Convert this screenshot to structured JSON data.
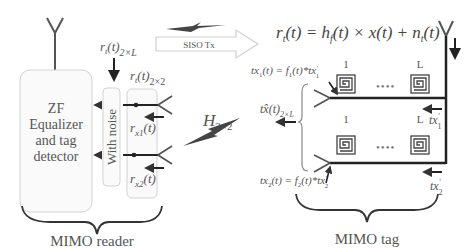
{
  "reader": {
    "box_label_lines": [
      "ZF",
      "Equalizer",
      "and tag",
      "detector"
    ],
    "noise_label": "With noise",
    "input_label_top": "r_t(t)_2xL",
    "input_label_top_parts": {
      "base": "r",
      "sub1": "t",
      "arg": "(t)",
      "sub2": "2×L"
    },
    "input_label_mid_parts": {
      "base": "r",
      "sub1": "t",
      "arg": "(t)",
      "sub2": "2×2"
    },
    "rx1_parts": {
      "base": "r",
      "sub": "x1",
      "arg": "(t)"
    },
    "rx2_parts": {
      "base": "r",
      "sub": "x2",
      "arg": "(t)"
    },
    "caption": "MIMO reader"
  },
  "channel": {
    "siso_label": "SISO Tx",
    "h_parts": {
      "base": "H",
      "sub": "2×2"
    }
  },
  "equation": {
    "lhs": "r",
    "lhs_sub": "t",
    "rest1": "(t) = h",
    "h_sub": "f",
    "rest2": "(t) × x(t) + n",
    "n_sub": "t",
    "rest3": "(t)"
  },
  "tag": {
    "tx1_parts": {
      "a": "tx",
      "a_sub": "1",
      "b": "(t) = f",
      "b_sub": "1",
      "c": "(t)*tx",
      "c_sup": "'",
      "c_sub": "1"
    },
    "tx2_parts": {
      "a": "tx",
      "a_sub": "2",
      "b": "(t) = f",
      "b_sub": "2",
      "c": "(t)*tx",
      "c_sup": "'",
      "c_sub": "2"
    },
    "txhat_parts": {
      "a": "tx̂",
      "b": "(t)",
      "sub": "2×L"
    },
    "row1_first": "1",
    "row1_last": "L",
    "row2_first": "1",
    "row2_last": "L",
    "txp1_parts": {
      "a": "tx",
      "sup": "'",
      "sub": "1"
    },
    "txp2_parts": {
      "a": "tx",
      "sup": "'",
      "sub": "2"
    },
    "dots": "••••",
    "caption": "MIMO tag"
  },
  "colors": {
    "line": "#333333",
    "box_stroke": "#cfcfcf",
    "box_fill": "#fafafa",
    "text": "#555555"
  }
}
